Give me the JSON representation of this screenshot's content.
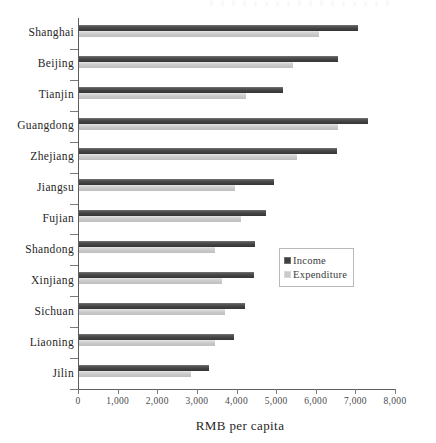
{
  "chart_data": {
    "type": "bar",
    "orientation": "horizontal",
    "title": "",
    "xlabel": "RMB per capita",
    "ylabel": "",
    "xlim": [
      0,
      8000
    ],
    "xticks": [
      0,
      1000,
      2000,
      3000,
      4000,
      5000,
      6000,
      7000,
      8000
    ],
    "xtick_labels": [
      "0",
      "1,000",
      "2,000",
      "3,000",
      "4,000",
      "5,000",
      "6,000",
      "7,000",
      "8,000"
    ],
    "grid": false,
    "legend_position": "center-right",
    "categories": [
      "Shanghai",
      "Beijing",
      "Tianjin",
      "Guangdong",
      "Zhejiang",
      "Jiangsu",
      "Fujian",
      "Shandong",
      "Xinjiang",
      "Sichuan",
      "Liaoning",
      "Jilin"
    ],
    "series": [
      {
        "name": "Income",
        "color": "#3f3f3f",
        "values": [
          7050,
          6540,
          5150,
          7300,
          6520,
          4920,
          4720,
          4440,
          4420,
          4190,
          3910,
          3290
        ]
      },
      {
        "name": "Expenditure",
        "color": "#cacaca",
        "values": [
          6060,
          5400,
          4220,
          6540,
          5500,
          3940,
          4090,
          3440,
          3620,
          3690,
          3430,
          2830
        ]
      }
    ]
  },
  "legend": {
    "items": [
      {
        "label": "Income",
        "swatch": "income"
      },
      {
        "label": "Expenditure",
        "swatch": "exp"
      }
    ]
  },
  "axis": {
    "x_title": "RMB per capita"
  }
}
